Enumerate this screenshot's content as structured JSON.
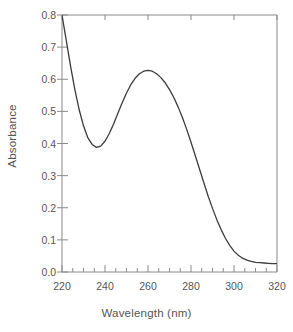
{
  "chart_data": {
    "type": "line",
    "title": "",
    "subtitle": "",
    "xlabel": "Wavelength (nm)",
    "ylabel": "Absorbance",
    "xlim": [
      220,
      320
    ],
    "ylim": [
      0.0,
      0.8
    ],
    "grid": false,
    "legend": null,
    "legend_position": "none",
    "x_major_ticks": [
      220,
      240,
      260,
      280,
      300,
      320
    ],
    "x_major_tick_labels": [
      "220",
      "240",
      "260",
      "280",
      "300",
      "320"
    ],
    "x_minor_tick_interval": 5,
    "y_major_ticks": [
      0.0,
      0.1,
      0.2,
      0.3,
      0.4,
      0.5,
      0.6,
      0.7,
      0.8
    ],
    "y_major_tick_labels": [
      "0.0",
      "0.1",
      "0.2",
      "0.3",
      "0.4",
      "0.5",
      "0.6",
      "0.7",
      "0.8"
    ],
    "series": [
      {
        "name": "Absorbance spectrum",
        "color": "#3b3b3b",
        "x": [
          220,
          222,
          224,
          226,
          228,
          230,
          232,
          234,
          236,
          238,
          240,
          242,
          244,
          246,
          248,
          250,
          252,
          254,
          256,
          258,
          260,
          262,
          264,
          266,
          268,
          270,
          272,
          274,
          276,
          278,
          280,
          282,
          284,
          286,
          288,
          290,
          292,
          294,
          296,
          298,
          300,
          302,
          304,
          306,
          308,
          310,
          312,
          314,
          316,
          318,
          320
        ],
        "y": [
          0.8,
          0.72,
          0.64,
          0.567,
          0.505,
          0.455,
          0.418,
          0.397,
          0.388,
          0.392,
          0.407,
          0.431,
          0.461,
          0.494,
          0.527,
          0.557,
          0.583,
          0.603,
          0.617,
          0.625,
          0.628,
          0.625,
          0.617,
          0.605,
          0.589,
          0.568,
          0.543,
          0.514,
          0.481,
          0.444,
          0.404,
          0.362,
          0.32,
          0.277,
          0.236,
          0.198,
          0.163,
          0.132,
          0.105,
          0.083,
          0.065,
          0.052,
          0.043,
          0.037,
          0.033,
          0.03,
          0.029,
          0.028,
          0.027,
          0.026,
          0.026
        ]
      }
    ],
    "annotations": [],
    "notes": {
      "peak_wavelength_nm": 260,
      "peak_absorbance": 0.628,
      "valley_wavelength_nm": 236,
      "valley_absorbance": 0.388,
      "baseline_absorbance": 0.026,
      "curve_clipped_at_top": true
    }
  },
  "style": {
    "axis_color": "#8a8a8a",
    "line_color": "#3b3b3b",
    "text_color": "#555555",
    "background": "#ffffff"
  }
}
